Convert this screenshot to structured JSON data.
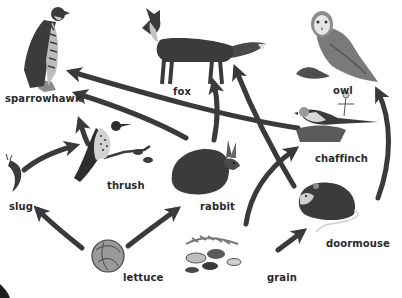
{
  "colors": {
    "arrow": "#3a3a3a",
    "label": "#2a2a2a",
    "dark": "#3b3b3b",
    "mid": "#6e6e6e",
    "light": "#a9a9a9",
    "background": "#ffffff"
  },
  "organisms": {
    "sparrowhawk": {
      "label": "sparrowhawk",
      "icon": "sparrowhawk-icon"
    },
    "fox": {
      "label": "fox",
      "icon": "fox-icon"
    },
    "owl": {
      "label": "owl",
      "icon": "owl-icon"
    },
    "thrush": {
      "label": "thrush",
      "icon": "thrush-icon"
    },
    "chaffinch": {
      "label": "chaffinch",
      "icon": "chaffinch-icon"
    },
    "slug": {
      "label": "slug",
      "icon": "slug-icon"
    },
    "rabbit": {
      "label": "rabbit",
      "icon": "rabbit-icon"
    },
    "doormouse": {
      "label": "doormouse",
      "icon": "doormouse-icon"
    },
    "lettuce": {
      "label": "lettuce",
      "icon": "lettuce-icon"
    },
    "grain": {
      "label": "grain",
      "icon": "grain-icon"
    }
  },
  "links": [
    {
      "from": "lettuce",
      "to": "slug"
    },
    {
      "from": "lettuce",
      "to": "rabbit"
    },
    {
      "from": "slug",
      "to": "thrush"
    },
    {
      "from": "thrush",
      "to": "sparrowhawk"
    },
    {
      "from": "chaffinch",
      "to": "sparrowhawk"
    },
    {
      "from": "rabbit",
      "to": "sparrowhawk"
    },
    {
      "from": "rabbit",
      "to": "fox"
    },
    {
      "from": "doormouse",
      "to": "fox"
    },
    {
      "from": "grain",
      "to": "chaffinch"
    },
    {
      "from": "grain",
      "to": "doormouse"
    },
    {
      "from": "doormouse",
      "to": "owl"
    }
  ]
}
